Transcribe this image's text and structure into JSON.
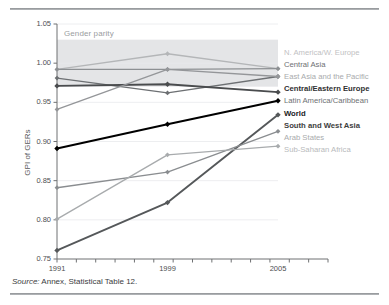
{
  "figure": {
    "source_prefix": "Source:",
    "source_text": " Annex, Statistical Table 12.",
    "band_label": "Gender parity"
  },
  "chart_data": {
    "type": "line",
    "title": "",
    "xlabel": "",
    "ylabel": "GPI of GERs",
    "x": [
      "1991",
      "1999",
      "2005"
    ],
    "categories": [
      "1991",
      "1999",
      "2005"
    ],
    "xtick_labels": [
      "1991",
      "1999",
      "2005"
    ],
    "ytick_labels": [
      "0.75",
      "0.80",
      "0.85",
      "0.90",
      "0.95",
      "1.00",
      "1.05"
    ],
    "ytick_values": [
      0.75,
      0.8,
      0.85,
      0.9,
      0.95,
      1.0,
      1.05
    ],
    "ylim": [
      0.75,
      1.05
    ],
    "grid": true,
    "legend_position": "right",
    "annotations": [
      {
        "text": "Gender parity",
        "band_from": 0.97,
        "band_to": 1.03
      }
    ],
    "series": [
      {
        "name": "N. America/W. Europe",
        "values": [
          0.992,
          1.012,
          0.993
        ],
        "color": "#b4b6b8",
        "bold": false
      },
      {
        "name": "Central Asia",
        "values": [
          0.992,
          0.992,
          0.993
        ],
        "color": "#8d9093",
        "bold": false
      },
      {
        "name": "East Asia and the Pacific",
        "values": [
          0.981,
          0.962,
          0.983
        ],
        "color": "#6d7073",
        "bold": false
      },
      {
        "name": "Central/Eastern Europe",
        "values": [
          0.971,
          0.973,
          0.963
        ],
        "color": "#4a4c4e",
        "bold": true
      },
      {
        "name": "Latin America/Caribbean",
        "values": [
          0.941,
          0.992,
          0.983
        ],
        "color": "#949699",
        "bold": false
      },
      {
        "name": "World",
        "values": [
          0.891,
          0.922,
          0.952
        ],
        "color": "#000000",
        "bold": true
      },
      {
        "name": "South and West Asia",
        "values": [
          0.761,
          0.822,
          0.934
        ],
        "color": "#55585a",
        "bold": true
      },
      {
        "name": "Arab States",
        "values": [
          0.841,
          0.861,
          0.913
        ],
        "color": "#8a8d90",
        "bold": false
      },
      {
        "name": "Sub-Saharan Africa",
        "values": [
          0.801,
          0.883,
          0.894
        ],
        "color": "#a8abad",
        "bold": false
      }
    ],
    "legend_text_colors": [
      "#bfc1c3",
      "#6e7073",
      "#a9abad",
      "#2f3032",
      "#6e7073",
      "#1a1b1c",
      "#3d3e40",
      "#a9abad",
      "#b8babc"
    ]
  }
}
